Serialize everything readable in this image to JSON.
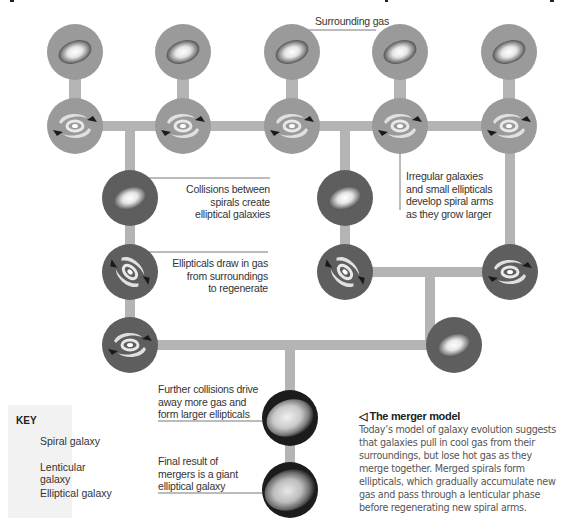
{
  "title_fragments": [
    "",
    ""
  ],
  "labels": {
    "surrounding_gas": "Surrounding gas",
    "collisions_spirals": [
      "Collisions between",
      "spirals create",
      "elliptical galaxies"
    ],
    "ellipticals_draw": [
      "Ellipticals draw in gas",
      "from surroundings",
      "to regenerate"
    ],
    "irregular": [
      "Irregular galaxies",
      "and small ellipticals",
      "develop spiral arms",
      "as they grow larger"
    ],
    "further_collisions": [
      "Further collisions drive",
      "away more gas and",
      "form larger ellipticals"
    ],
    "final_result": [
      "Final result of",
      "mergers is a giant",
      "elliptical galaxy"
    ]
  },
  "key": {
    "title": "KEY",
    "items": [
      {
        "icon": "spiral-galaxy-icon",
        "label": "Spiral galaxy"
      },
      {
        "icon": "lenticular-galaxy-icon",
        "label": "Lenticular galaxy"
      },
      {
        "icon": "elliptical-galaxy-icon",
        "label": "Elliptical galaxy"
      }
    ]
  },
  "caption": {
    "marker": "◁",
    "title": "The merger model",
    "body": "Today’s model of galaxy evolution suggests that galaxies pull in cool gas from their surroundings, but lose hot gas as they merge together. Merged spirals form ellipticals, which gradually accumulate new gas and pass through a lenticular phase before regenerating new spiral arms."
  },
  "colors": {
    "spiral_disc": "#9a9a9a",
    "lenticular_disc": "#5e5e5e",
    "elliptical_disc": "#1c1c1c",
    "connector": "#b4b4b4",
    "key_bg": "#f2f2f2"
  },
  "nodes": [
    {
      "type": "spiral",
      "x": 75,
      "y": 52,
      "content": "gas"
    },
    {
      "type": "spiral",
      "x": 183,
      "y": 52,
      "content": "gas"
    },
    {
      "type": "spiral",
      "x": 292,
      "y": 52,
      "content": "gas"
    },
    {
      "type": "spiral",
      "x": 400,
      "y": 52,
      "content": "gas"
    },
    {
      "type": "spiral",
      "x": 509,
      "y": 52,
      "content": "gas"
    },
    {
      "type": "spiral",
      "x": 75,
      "y": 126,
      "content": "arms"
    },
    {
      "type": "spiral",
      "x": 183,
      "y": 126,
      "content": "arms"
    },
    {
      "type": "spiral",
      "x": 292,
      "y": 126,
      "content": "arms"
    },
    {
      "type": "spiral",
      "x": 400,
      "y": 126,
      "content": "arms"
    },
    {
      "type": "spiral",
      "x": 509,
      "y": 126,
      "content": "arms"
    },
    {
      "type": "lenticular",
      "x": 130,
      "y": 198,
      "content": "core"
    },
    {
      "type": "lenticular",
      "x": 345,
      "y": 198,
      "content": "core"
    },
    {
      "type": "lenticular",
      "x": 130,
      "y": 272,
      "content": "arms"
    },
    {
      "type": "lenticular",
      "x": 345,
      "y": 272,
      "content": "arms"
    },
    {
      "type": "lenticular",
      "x": 510,
      "y": 272,
      "content": "arms"
    },
    {
      "type": "lenticular",
      "x": 130,
      "y": 345,
      "content": "arms"
    },
    {
      "type": "lenticular",
      "x": 454,
      "y": 345,
      "content": "core"
    },
    {
      "type": "elliptical",
      "x": 290,
      "y": 418,
      "content": "core"
    },
    {
      "type": "elliptical",
      "x": 290,
      "y": 490,
      "content": "core"
    }
  ]
}
